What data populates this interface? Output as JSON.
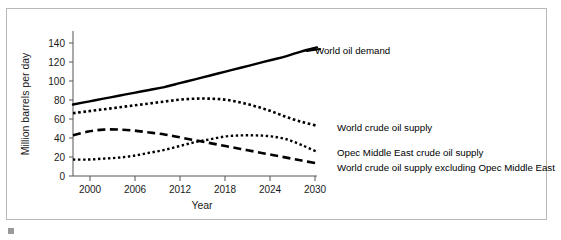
{
  "figure": {
    "frame_border_color": "#b9b9b9",
    "background": "#ffffff"
  },
  "chart_data": {
    "type": "line",
    "title": "",
    "xlabel": "Year",
    "ylabel": "Million barrels per day",
    "xlim": [
      1998,
      2030
    ],
    "ylim": [
      0,
      150
    ],
    "xticks": [
      2000,
      2006,
      2012,
      2018,
      2024,
      2030
    ],
    "yticks": [
      0,
      20,
      40,
      60,
      80,
      100,
      120,
      140
    ],
    "grid": false,
    "legend_position": "right-inline-annotations",
    "x": [
      1998,
      2000,
      2002,
      2004,
      2006,
      2008,
      2010,
      2012,
      2014,
      2016,
      2018,
      2020,
      2022,
      2024,
      2026,
      2028,
      2030
    ],
    "series": [
      {
        "name": "World oil demand",
        "style": "solid",
        "color": "#000000",
        "label": "World oil demand",
        "values": [
          74,
          77,
          80,
          83,
          86,
          89,
          92,
          96,
          100,
          104,
          108,
          112,
          116,
          120,
          124,
          129,
          133
        ]
      },
      {
        "name": "World crude oil supply",
        "style": "dotted-thick",
        "color": "#000000",
        "label": "World crude oil supply",
        "values": [
          65,
          67,
          69,
          71,
          73,
          75,
          77,
          79,
          80,
          80,
          79,
          76,
          72,
          67,
          61,
          56,
          52
        ]
      },
      {
        "name": "Opec Middle East crude oil supply",
        "style": "dotted-fine",
        "color": "#000000",
        "label": "Opec Middle East crude oil supply",
        "values": [
          17,
          17,
          18,
          19,
          21,
          24,
          27,
          31,
          35,
          38,
          41,
          42,
          42,
          41,
          38,
          32,
          25
        ]
      },
      {
        "name": "World crude oil supply excluding Opec Middle East",
        "style": "dashed",
        "color": "#000000",
        "label": "World crude oil supply excluding Opec Middle East",
        "values": [
          42,
          46,
          48,
          48,
          47,
          45,
          43,
          40,
          37,
          34,
          31,
          28,
          25,
          22,
          19,
          16,
          13
        ]
      }
    ]
  }
}
